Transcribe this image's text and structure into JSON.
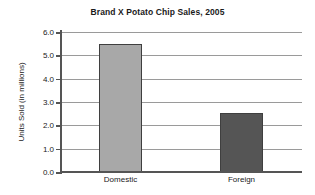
{
  "chart_data": {
    "type": "bar",
    "title": "Brand X Potato Chip Sales, 2005",
    "xlabel": "",
    "ylabel": "Units Sold (in millions)",
    "categories": [
      "Domestic",
      "Foreign"
    ],
    "values": [
      5.5,
      2.55
    ],
    "series": [
      {
        "name": "Units Sold",
        "values": [
          5.5,
          2.55
        ]
      }
    ],
    "ylim": [
      0.0,
      6.0
    ],
    "ytick_labels": [
      "0.0",
      "1.0",
      "2.0",
      "3.0",
      "4.0",
      "5.0",
      "6.0"
    ],
    "ytick_values": [
      0.0,
      1.0,
      2.0,
      3.0,
      4.0,
      5.0,
      6.0
    ],
    "grid": true,
    "legend": false,
    "legend_position": "none",
    "bar_colors": [
      "#a8a8a8",
      "#555555"
    ],
    "bar_border_color": "#3f3f3f",
    "gridline_color": "#9a9a9a",
    "axis_color": "#555555",
    "background_color": "#ffffff",
    "text_color": "#1a1a1a"
  }
}
